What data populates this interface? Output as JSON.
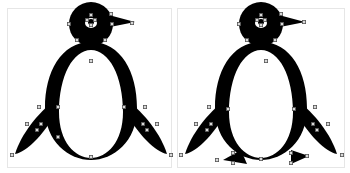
{
  "figure": {
    "panels": [
      {
        "id": "left",
        "label": "",
        "subject": "penguin without feet",
        "has_feet": false
      },
      {
        "id": "right",
        "label": "",
        "subject": "penguin with feet",
        "has_feet": true
      }
    ],
    "colors": {
      "fill": "#000000",
      "background": "#ffffff",
      "anchor_point_fill": "#d8d8d8",
      "anchor_point_stroke": "#555555",
      "panel_border": "#e6e6e6"
    }
  }
}
